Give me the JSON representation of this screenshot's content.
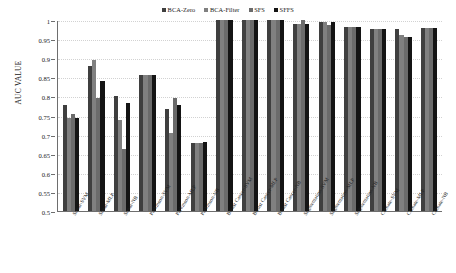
{
  "chart_data": {
    "type": "bar",
    "title": "",
    "subtitle": "",
    "xlabel": "",
    "ylabel": "AUC VALUE",
    "ylim": [
      0.5,
      1
    ],
    "ytick_step": 0.05,
    "yticks": [
      "1",
      "0.95",
      "0.9",
      "0.85",
      "0.8",
      "0.75",
      "0.7",
      "0.65",
      "0.6",
      "0.55",
      "0.5"
    ],
    "grid": true,
    "legend_position": "top-center",
    "categories": [
      "Sonar-SVM",
      "Sonar-MLP",
      "Sonar-NB",
      "Parkinson-SVM",
      "Parkinson-MLP",
      "Parkinson-NB",
      "Breast Cancer-SVM",
      "Breast Cancer-MLP",
      "Breast Cancer-NB",
      "Segmentation-SVM",
      "Segmentation-MLP",
      "Segmentation-NB",
      "Climate-SVM",
      "Climate-MLP",
      "Climate-NB"
    ],
    "series": [
      {
        "name": "BCA-Zero",
        "color": "#3f3f3f",
        "values": [
          0.778,
          0.88,
          0.802,
          0.855,
          0.768,
          0.678,
          0.999,
          1.0,
          1.0,
          0.989,
          0.994,
          0.982,
          0.976,
          0.976,
          0.98
        ]
      },
      {
        "name": "BCA-Filter",
        "color": "#808080",
        "values": [
          0.744,
          0.896,
          0.739,
          0.855,
          0.704,
          0.677,
          0.999,
          1.0,
          1.0,
          0.99,
          0.996,
          0.982,
          0.976,
          0.962,
          0.98
        ]
      },
      {
        "name": "SFS",
        "color": "#6b6b6b",
        "values": [
          0.755,
          0.795,
          0.663,
          0.855,
          0.795,
          0.679,
          0.999,
          1.0,
          1.0,
          1.0,
          0.988,
          0.982,
          0.976,
          0.956,
          0.98
        ]
      },
      {
        "name": "SFFS",
        "color": "#141414",
        "values": [
          0.744,
          0.84,
          0.782,
          0.855,
          0.777,
          0.681,
          0.999,
          1.0,
          1.0,
          0.99,
          0.995,
          0.982,
          0.976,
          0.955,
          0.98
        ]
      }
    ]
  },
  "legend": {
    "items": [
      {
        "label": "BCA-Zero",
        "color": "#3f3f3f"
      },
      {
        "label": "BCA-Filter",
        "color": "#808080"
      },
      {
        "label": "SFS",
        "color": "#6b6b6b"
      },
      {
        "label": "SFFS",
        "color": "#141414"
      }
    ]
  }
}
